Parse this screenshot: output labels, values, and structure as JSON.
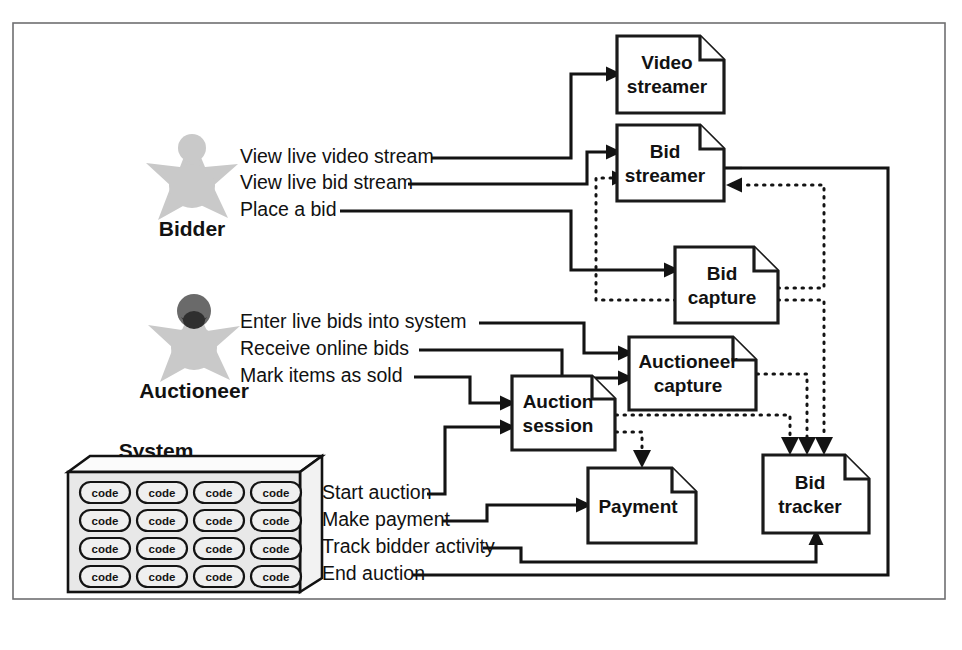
{
  "figure": {
    "frame": {
      "x": 13,
      "y": 23,
      "width": 932,
      "height": 576
    }
  },
  "colors": {
    "frame_border": "#6f6f71",
    "line": "#131313",
    "box_border": "#1a1a1a",
    "box_fill": "#ffffff",
    "actor_body": "#c9c9c9",
    "actor_head_dark": "#6a6a6a",
    "actor_beard": "#2f2f2f",
    "system_face": "#e8e8e8",
    "code_pill_fill": "#efefef",
    "text": "#121212"
  },
  "actors": [
    {
      "id": "bidder",
      "label": "Bidder",
      "icon": "star-person-icon",
      "x": 192,
      "y": 178,
      "label_x": 192,
      "label_y": 228,
      "has_dark_head": false
    },
    {
      "id": "auctioneer",
      "label": "Auctioneer",
      "icon": "star-person-bearded-icon",
      "x": 194,
      "y": 340,
      "label_x": 194,
      "label_y": 390,
      "has_dark_head": true
    }
  ],
  "system": {
    "label": "System",
    "label_x": 156,
    "label_y": 452,
    "icon": "code-crate-icon",
    "code_label": "code",
    "rows": 4,
    "columns": 4,
    "box": {
      "x": 68,
      "y": 470,
      "width": 232,
      "height": 122
    }
  },
  "use_cases": [
    {
      "id": "view-live-video-stream",
      "label": "View live video stream",
      "x": 240,
      "y": 158,
      "actor": "bidder",
      "target": "video-streamer"
    },
    {
      "id": "view-live-bid-stream",
      "label": "View live bid stream",
      "x": 240,
      "y": 184,
      "actor": "bidder",
      "target": "bid-streamer"
    },
    {
      "id": "place-a-bid",
      "label": "Place a bid",
      "x": 240,
      "y": 211,
      "actor": "bidder",
      "target": "bid-capture"
    },
    {
      "id": "enter-live-bids-into-system",
      "label": "Enter live bids into system",
      "x": 240,
      "y": 323,
      "actor": "auctioneer",
      "target": "auctioneer-capture"
    },
    {
      "id": "receive-online-bids",
      "label": "Receive online bids",
      "x": 240,
      "y": 350,
      "actor": "auctioneer",
      "target": "auctioneer-capture"
    },
    {
      "id": "mark-items-as-sold",
      "label": "Mark items as sold",
      "x": 240,
      "y": 377,
      "actor": "auctioneer",
      "target": "auction-session"
    },
    {
      "id": "start-auction",
      "label": "Start auction",
      "x": 322,
      "y": 494,
      "actor": "system",
      "target": "auction-session"
    },
    {
      "id": "make-payment",
      "label": "Make payment",
      "x": 322,
      "y": 521,
      "actor": "system",
      "target": "payment"
    },
    {
      "id": "track-bidder-activity",
      "label": "Track bidder activity",
      "x": 322,
      "y": 548,
      "actor": "system",
      "target": "bid-tracker"
    },
    {
      "id": "end-auction",
      "label": "End auction",
      "x": 322,
      "y": 575,
      "actor": "system",
      "target": "bid-streamer"
    }
  ],
  "components": [
    {
      "id": "video-streamer",
      "lines": [
        "Video",
        "streamer"
      ],
      "x": 617,
      "y": 36,
      "width": 107,
      "height": 77
    },
    {
      "id": "bid-streamer",
      "lines": [
        "Bid",
        "streamer"
      ],
      "x": 617,
      "y": 125,
      "width": 107,
      "height": 76
    },
    {
      "id": "bid-capture",
      "lines": [
        "Bid",
        "capture"
      ],
      "x": 675,
      "y": 247,
      "width": 103,
      "height": 76
    },
    {
      "id": "auctioneer-capture",
      "lines": [
        "Auctioneer",
        "capture"
      ],
      "x": 629,
      "y": 337,
      "width": 127,
      "height": 73
    },
    {
      "id": "auction-session",
      "lines": [
        "Auction",
        "session"
      ],
      "x": 512,
      "y": 376,
      "width": 103,
      "height": 74
    },
    {
      "id": "payment",
      "lines": [
        "Payment"
      ],
      "x": 588,
      "y": 468,
      "width": 108,
      "height": 75
    },
    {
      "id": "bid-tracker",
      "lines": [
        "Bid",
        "tracker"
      ],
      "x": 763,
      "y": 455,
      "width": 106,
      "height": 78
    }
  ],
  "connections": [
    {
      "id": "bid-capture-to-bid-streamer",
      "style": "dotted",
      "from": "bid-capture",
      "to": "bid-streamer"
    },
    {
      "id": "auctioneer-capture-to-bid-streamer",
      "style": "dotted",
      "from": "auctioneer-capture",
      "to": "bid-streamer"
    },
    {
      "id": "bid-capture-to-bid-tracker",
      "style": "dotted",
      "from": "bid-capture",
      "to": "bid-tracker"
    },
    {
      "id": "auctioneer-capture-to-bid-tracker",
      "style": "dotted",
      "from": "auctioneer-capture",
      "to": "bid-tracker"
    },
    {
      "id": "auction-session-to-bid-tracker",
      "style": "dotted",
      "from": "auction-session",
      "to": "bid-tracker"
    },
    {
      "id": "auction-session-to-payment",
      "style": "dotted",
      "from": "auction-session",
      "to": "payment"
    },
    {
      "id": "bid-streamer-to-bid-tracker-loop",
      "style": "solid",
      "from": "bid-streamer",
      "to": "bid-tracker"
    }
  ]
}
